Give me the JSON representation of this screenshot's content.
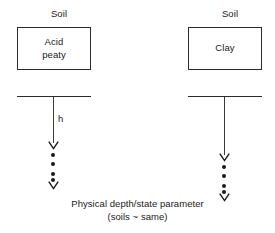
{
  "figure": {
    "caption_line1": "Physical depth/state parameter",
    "caption_line2": "(soils ~ same)"
  },
  "columns": [
    {
      "id": "left",
      "header_label": "Soil",
      "box_text": "Acid\npeaty",
      "depth_label": "h",
      "markers": {
        "arrow_top_y": 142,
        "dots_y": [
          154,
          163,
          172,
          178
        ],
        "arrow_bottom_y": 182
      }
    },
    {
      "id": "right",
      "header_label": "Soil",
      "box_text": "Clay",
      "depth_label": "",
      "markers": {
        "arrow_top_y": 154,
        "dots_y": [
          166,
          175,
          184,
          190
        ],
        "arrow_bottom_y": 194
      }
    }
  ],
  "style": {
    "stroke_color": "#2b2b2b",
    "dot_color": "#1a1a1a",
    "background": "#ffffff"
  }
}
